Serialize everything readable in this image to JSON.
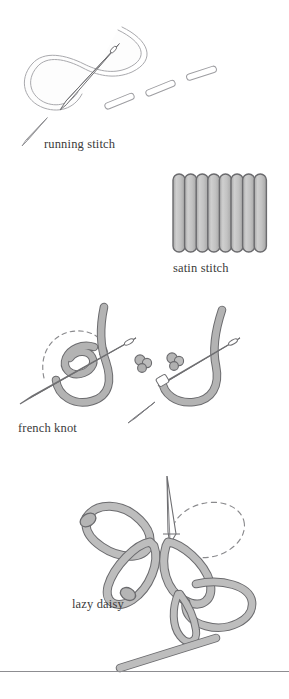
{
  "page": {
    "background_color": "#ffffff",
    "width": 289,
    "height": 699
  },
  "palette": {
    "text": "#3a3a3a",
    "outline_dark": "#6b6b6e",
    "outline_light": "#a9a9ad",
    "thread_fill_gray": "#b3b3b3",
    "thread_fill_light": "#fdfdfd",
    "needle_fill": "#ffffff",
    "needle_outline": "#6f6f72",
    "dash_guide": "#8a8a8d",
    "divider": "#8d8d91"
  },
  "figures": [
    {
      "id": "running-stitch",
      "caption": "running stitch",
      "description": "A threaded needle passing through fabric with a loose loop of thread behind it and three completed dash-shaped stitches running diagonally up to the right.",
      "elements": {
        "loop_count": 1,
        "needle_count": 2,
        "completed_stitch_dashes": 3,
        "thread_style": "light outline"
      }
    },
    {
      "id": "satin-stitch",
      "caption": "satin stitch",
      "description": "A solid block of eight parallel vertical rounded stitches packed side by side.",
      "elements": {
        "bar_count": 8,
        "bar_fill": "#b9b9b9",
        "bar_outline": "#6b6b6e",
        "orientation": "vertical"
      }
    },
    {
      "id": "french-knot",
      "caption": "french knot",
      "description": "A needle with thread wrapped twice around it, a dashed circular arrow showing the wrapping direction, two finished knots, and a second needle drawing the thread through.",
      "elements": {
        "needle_count": 3,
        "wrap_turns": 2,
        "finished_knots": 2,
        "direction_arrow": "dashed circular arrow, clockwise",
        "thread_style": "filled gray"
      }
    },
    {
      "id": "lazy-daisy",
      "caption": "lazy daisy",
      "description": "Three detached chain petal loops arranged like flower petals, a needle coming up through the fabric and a dashed oval marking the next petal position.",
      "elements": {
        "petal_count": 3,
        "needle_count": 2,
        "guide_shape": "dashed oval",
        "thread_style": "filled gray"
      }
    }
  ],
  "divider": {
    "present": true,
    "color": "#8d8d91"
  }
}
